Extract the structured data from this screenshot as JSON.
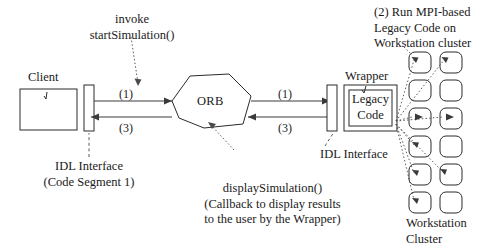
{
  "figure": {
    "nodes": {
      "client": "Client",
      "orb": "ORB",
      "wrapper": "Wrapper",
      "legacy_code_line1": "Legacy",
      "legacy_code_line2": "Code"
    },
    "annotations": {
      "invoke_line1": "invoke",
      "invoke_line2": "startSimulation()",
      "step1": "(1)",
      "step3_left": "(3)",
      "step1_right": "(1)",
      "step3_right": "(3)",
      "mpi_line1": "(2) Run MPI-based",
      "mpi_line2": "Legacy Code on",
      "mpi_line3": "Workstation cluster",
      "idl_left_line1": "IDL Interface",
      "idl_left_line2": "(Code Segment 1)",
      "idl_right": "IDL Interface",
      "display_line1": "displaySimulation()",
      "display_line2": "(Callback to display results",
      "display_line3": "to the user by the Wrapper)",
      "cluster_line1": "Workstation",
      "cluster_line2": "Cluster"
    },
    "colors": {
      "stroke": "#2b2b2b",
      "background": "#ffffff",
      "dotted": "#4a4a4a"
    },
    "workstation_cluster": {
      "rows": 6,
      "columns": 2,
      "node_count": 12
    }
  }
}
